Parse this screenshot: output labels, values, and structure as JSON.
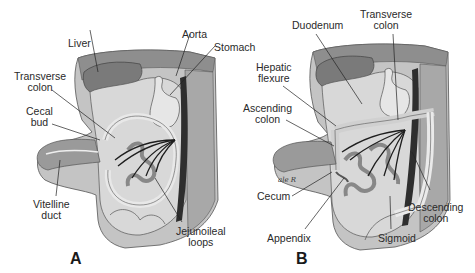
{
  "figure": {
    "panels": [
      {
        "id": "A",
        "letter": "A",
        "labels": {
          "liver": "Liver",
          "aorta": "Aorta",
          "stomach": "Stomach",
          "transverse_colon_1": "Transverse",
          "transverse_colon_2": "colon",
          "cecal_bud_1": "Cecal",
          "cecal_bud_2": "bud",
          "vitelline_duct_1": "Vitelline",
          "vitelline_duct_2": "duct",
          "jejunoileal_loops_1": "Jejunoileal",
          "jejunoileal_loops_2": "loops"
        }
      },
      {
        "id": "B",
        "letter": "B",
        "labels": {
          "duodenum": "Duodenum",
          "transverse_colon_1": "Transverse",
          "transverse_colon_2": "colon",
          "hepatic_flexure_1": "Hepatic",
          "hepatic_flexure_2": "flexure",
          "ascending_colon_1": "Ascending",
          "ascending_colon_2": "colon",
          "cecum": "Cecum",
          "appendix": "Appendix",
          "sigmoid": "Sigmoid",
          "descending_colon_1": "Descending",
          "descending_colon_2": "colon"
        },
        "signature": "ale R"
      }
    ],
    "colors": {
      "background": "#ffffff",
      "body_wall": "#bdbdbd",
      "body_wall_dark": "#8a8a8a",
      "liver": "#7d7d7d",
      "gut": "#d6d6d6",
      "gut_outline": "#555555",
      "aorta": "#2e2e2e",
      "vessels": "#1e1e1e",
      "text": "#2a2a2a"
    }
  }
}
